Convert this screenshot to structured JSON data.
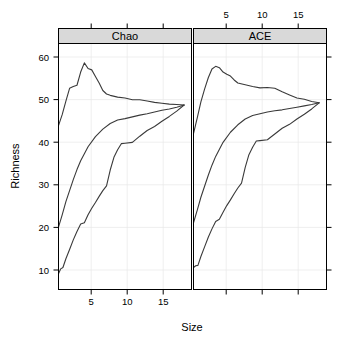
{
  "chart_data": {
    "type": "line",
    "title": "",
    "xlabel": "Size",
    "ylabel": "Richness",
    "xlim": [
      1,
      19
    ],
    "ylim": [
      7,
      63
    ],
    "grid": true,
    "legend_position": "none",
    "layout": "trellis 1x2 panels, strip headers on top, x-axis alternating (bottom for panel 1, top for panel 2), y-axis on left, tick marks on all four sides",
    "panels": [
      {
        "name": "Chao",
        "strip_label": "Chao",
        "axis_side": "bottom",
        "xticks": [
          5,
          10,
          15
        ],
        "xtick_labels": [
          "5",
          "10",
          "15"
        ],
        "series": [
          {
            "name": "Chao estimator",
            "x": [
              1,
              1.5,
              2,
              2.5,
              3,
              3.5,
              4,
              4.5,
              5,
              5.5,
              6,
              6.5,
              7,
              7.5,
              8,
              9,
              10,
              11,
              12,
              13,
              14,
              15,
              16,
              17,
              18
            ],
            "values": [
              44.3,
              46.8,
              49.9,
              52.8,
              53.2,
              53.5,
              56.5,
              58.6,
              57.3,
              57.0,
              55.5,
              54.0,
              52.3,
              51.5,
              51.2,
              50.8,
              50.6,
              50.2,
              50.2,
              49.9,
              49.6,
              49.4,
              49.2,
              49.1,
              49.0
            ]
          },
          {
            "name": "ACE-style lower band",
            "x": [
              1,
              1.5,
              2,
              2.5,
              3,
              3.5,
              4,
              5,
              6,
              7,
              8,
              9,
              10,
              11,
              12,
              13,
              14,
              15,
              16,
              17,
              18
            ],
            "values": [
              21.2,
              24.0,
              27.0,
              29.5,
              32.0,
              34.3,
              36.3,
              39.5,
              41.8,
              43.5,
              44.8,
              45.6,
              45.9,
              46.3,
              46.7,
              47.0,
              47.4,
              47.8,
              48.1,
              48.5,
              49.0
            ]
          },
          {
            "name": "Observed richness (rarefaction)",
            "x": [
              1,
              1.3,
              1.6,
              2,
              2.5,
              3,
              3.5,
              4,
              4.5,
              5,
              5.5,
              6,
              6.5,
              7,
              7.5,
              8,
              8.5,
              9,
              9.5,
              10,
              11,
              12,
              13,
              14,
              15,
              16,
              17,
              18
            ],
            "values": [
              10.6,
              11.7,
              12.0,
              14.0,
              16.1,
              18.3,
              20.2,
              21.9,
              22.2,
              24.0,
              25.5,
              26.8,
              28.2,
              29.5,
              30.6,
              34.2,
              37.1,
              38.8,
              40.2,
              40.3,
              40.5,
              41.9,
              43.2,
              44.1,
              45.3,
              46.4,
              47.6,
              49.0
            ]
          }
        ]
      },
      {
        "name": "ACE",
        "strip_label": "ACE",
        "axis_side": "top",
        "xticks": [
          5,
          10,
          15
        ],
        "xtick_labels": [
          "5",
          "10",
          "15"
        ],
        "series": [
          {
            "name": "ACE estimator",
            "x": [
              1,
              1.5,
              2,
              2.5,
              3,
              3.5,
              4,
              4.5,
              5,
              5.5,
              6,
              6.5,
              7,
              8,
              9,
              10,
              11,
              12,
              13,
              14,
              15,
              16,
              17,
              18
            ],
            "values": [
              42.5,
              46.0,
              49.7,
              52.6,
              55.2,
              57.2,
              57.8,
              57.5,
              56.5,
              56.0,
              55.6,
              54.7,
              54.0,
              53.6,
              53.2,
              52.9,
              53.0,
              52.8,
              52.0,
              51.3,
              50.6,
              50.3,
              49.8,
              49.5
            ]
          },
          {
            "name": "ACE lower band",
            "x": [
              1,
              1.5,
              2,
              2.5,
              3,
              3.5,
              4,
              5,
              6,
              7,
              8,
              9,
              10,
              11,
              12,
              13,
              14,
              15,
              16,
              17,
              18
            ],
            "values": [
              22.2,
              25.0,
              28.0,
              30.5,
              33.0,
              35.3,
              37.3,
              40.5,
              42.8,
              44.5,
              45.8,
              46.6,
              47.0,
              47.4,
              47.7,
              47.9,
              48.2,
              48.5,
              48.8,
              49.1,
              49.5
            ]
          },
          {
            "name": "Observed richness (rarefaction)",
            "x": [
              1,
              1.3,
              1.6,
              2,
              2.5,
              3,
              3.5,
              4,
              4.5,
              5,
              5.5,
              6,
              6.5,
              7,
              7.5,
              8,
              8.5,
              9,
              9.5,
              10,
              11,
              12,
              13,
              14,
              15,
              16,
              17,
              18
            ],
            "values": [
              12.0,
              12.4,
              12.5,
              14.5,
              16.7,
              18.9,
              20.8,
              22.5,
              23.0,
              24.6,
              26.1,
              27.4,
              28.8,
              30.1,
              31.2,
              34.8,
              37.7,
              39.4,
              40.8,
              40.9,
              41.1,
              42.4,
              43.7,
              44.6,
              45.8,
              46.9,
              48.1,
              49.5
            ]
          }
        ]
      }
    ],
    "yticks": [
      10,
      20,
      30,
      40,
      50,
      60
    ],
    "ytick_labels": [
      "10",
      "20",
      "30",
      "40",
      "50",
      "60"
    ]
  }
}
